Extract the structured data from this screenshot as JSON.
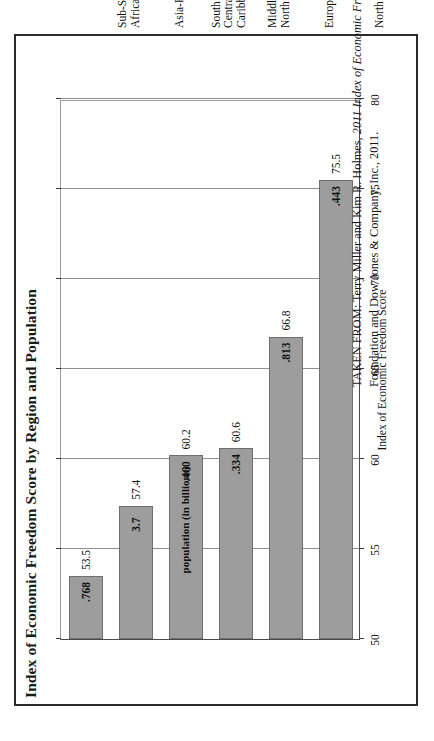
{
  "figure": {
    "title": "Index of Economic Freedom Score by Region and Population",
    "source_prefix": "TAKEN FROM: Terry Miller and Kim R. Holmes, ",
    "source_italic": "2011 Index of Economic Freedom.",
    "source_suffix": " Washington, DC: The Heritage Foundation and Dow Jones & Company, Inc., 2011.",
    "population_note": "population (in billions)"
  },
  "chart_data": {
    "type": "bar",
    "orientation": "horizontal",
    "title": "Index of Economic Freedom Score by Region and Population",
    "xlabel": "Index of Economic Freedom Score",
    "ylabel": "",
    "xlim": [
      50,
      80
    ],
    "xticks": [
      50,
      55,
      60,
      65,
      70,
      75,
      80
    ],
    "xticklabels": [
      "50",
      "55",
      "60",
      "65",
      "70",
      "75",
      "80"
    ],
    "grid": true,
    "legend": "none",
    "annotations": [
      "population (in billions)"
    ],
    "categories": [
      "Sub-Saharan Africa",
      "Asia-Pacific",
      "South and Central America/Caribbean",
      "Middle East/North Africa",
      "Europe",
      "North America"
    ],
    "category_lines": [
      [
        "Sub-Saharan",
        "Africa"
      ],
      [
        "Asia-Pacific"
      ],
      [
        "South and",
        "Central America/",
        "Caribbean"
      ],
      [
        "Middle East/",
        "North Africa"
      ],
      [
        "Europe"
      ],
      [
        "North America"
      ]
    ],
    "series": [
      {
        "name": "Index of Economic Freedom Score",
        "values": [
          53.5,
          57.4,
          60.2,
          60.6,
          66.8,
          75.5
        ]
      },
      {
        "name": "population (in billions)",
        "values": [
          0.768,
          3.7,
          0.46,
          0.334,
          0.813,
          0.443
        ],
        "labels": [
          ".768",
          "3.7",
          ".460",
          ".334",
          ".813",
          ".443"
        ]
      }
    ],
    "score_labels": [
      "53.5",
      "57.4",
      "60.2",
      "60.6",
      "66.8",
      "75.5"
    ]
  },
  "colors": {
    "bar_fill": "#9d9d9d",
    "bar_border": "#6f6f6f",
    "frame": "#2b2b2b",
    "grid": "#8f8f8f",
    "text": "#121212"
  }
}
